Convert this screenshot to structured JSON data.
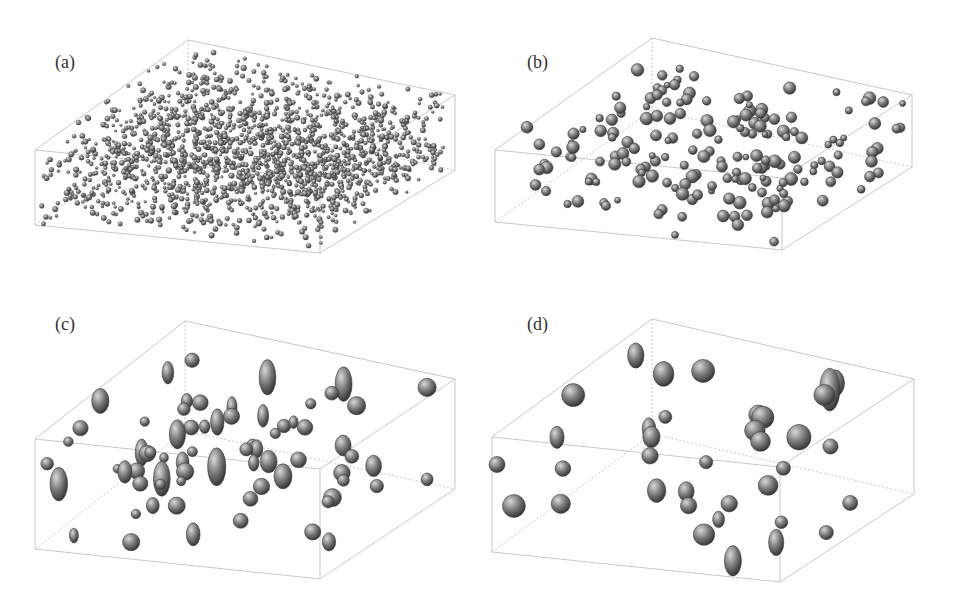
{
  "figure": {
    "panels": [
      {
        "label": "(a)",
        "description": "dense fine-grained particle microstructure in 3D box",
        "particle_scale": 4,
        "density": 0.95
      },
      {
        "label": "(b)",
        "description": "coarser particles, moderate density",
        "particle_scale": 9,
        "density": 0.5
      },
      {
        "label": "(c)",
        "description": "larger elongated particles",
        "particle_scale": 13,
        "density": 0.4
      },
      {
        "label": "(d)",
        "description": "largest coarsened particles",
        "particle_scale": 17,
        "density": 0.35
      }
    ],
    "colors": {
      "background": "#ffffff",
      "box_edge": "#bbbbbb",
      "particle_dark": "#3a3a3a",
      "particle_mid": "#7a7a7a",
      "particle_light": "#d8d8d8"
    }
  }
}
